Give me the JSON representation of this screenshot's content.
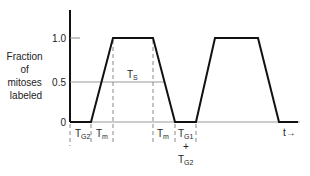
{
  "diagram": {
    "type": "labeled-mitoses-curve",
    "y_axis": {
      "label_lines": [
        "Fraction",
        "of",
        "mitoses",
        "labeled"
      ],
      "ticks": [
        "1.0",
        "0.5",
        "0"
      ]
    },
    "x_axis": {
      "label": "t→"
    },
    "interval_labels": {
      "tg2": "T",
      "tg2_sub": "G2",
      "tm1": "T",
      "tm1_sub": "m",
      "ts": "T",
      "ts_sub": "S",
      "tm2": "T",
      "tm2_sub": "m",
      "tg1": "T",
      "tg1_sub": "G1",
      "plus": "+",
      "tg2b": "T",
      "tg2b_sub": "G2"
    },
    "colors": {
      "curve": "#111111",
      "axis": "#111111",
      "guide": "#888888",
      "text": "#222222"
    }
  }
}
